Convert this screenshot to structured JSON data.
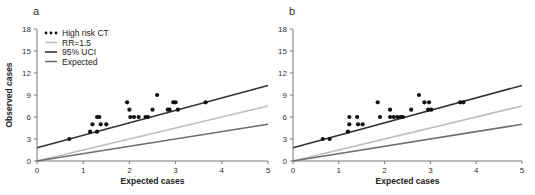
{
  "chart_data": [
    {
      "type": "scatter",
      "panel": "a",
      "title": "",
      "xlabel": "Expected cases",
      "ylabel": "Observed cases",
      "xlim": [
        0,
        5
      ],
      "ylim": [
        0,
        18
      ],
      "xticks": [
        0,
        1,
        2,
        3,
        4,
        5
      ],
      "yticks": [
        0,
        3,
        6,
        9,
        12,
        15,
        18
      ],
      "grid": false,
      "legend_position": "upper left",
      "legend": [
        "High risk CT",
        "RR=1.5",
        "95% UCI",
        "Expected"
      ],
      "series": [
        {
          "name": "High risk CT",
          "kind": "points",
          "color": "#111111",
          "points": [
            [
              0.7,
              3
            ],
            [
              1.15,
              4
            ],
            [
              1.2,
              5
            ],
            [
              1.3,
              4
            ],
            [
              1.3,
              6
            ],
            [
              1.35,
              6
            ],
            [
              1.38,
              5
            ],
            [
              1.5,
              5
            ],
            [
              1.95,
              8
            ],
            [
              2.0,
              7
            ],
            [
              2.02,
              6
            ],
            [
              2.1,
              6
            ],
            [
              2.2,
              6
            ],
            [
              2.35,
              6
            ],
            [
              2.4,
              6
            ],
            [
              2.5,
              7
            ],
            [
              2.6,
              9
            ],
            [
              2.83,
              7
            ],
            [
              2.87,
              7
            ],
            [
              2.95,
              8
            ],
            [
              3.0,
              8
            ],
            [
              3.05,
              7
            ],
            [
              3.65,
              8
            ]
          ]
        },
        {
          "name": "RR=1.5",
          "kind": "line",
          "color": "#bdbdbd",
          "x": [
            0,
            5
          ],
          "y": [
            0,
            7.5
          ]
        },
        {
          "name": "95% UCI",
          "kind": "line",
          "color": "#333333",
          "x": [
            0,
            5
          ],
          "y": [
            1.8,
            10.3
          ]
        },
        {
          "name": "Expected",
          "kind": "line",
          "color": "#6e6e6e",
          "x": [
            0,
            5
          ],
          "y": [
            0,
            5
          ]
        }
      ]
    },
    {
      "type": "scatter",
      "panel": "b",
      "title": "",
      "xlabel": "Expected cases",
      "ylabel": "",
      "xlim": [
        0,
        5
      ],
      "ylim": [
        0,
        18
      ],
      "xticks": [
        0,
        1,
        2,
        3,
        4,
        5
      ],
      "yticks": [
        0,
        3,
        6,
        9,
        12,
        15,
        18
      ],
      "grid": false,
      "series": [
        {
          "name": "High risk CT",
          "kind": "points",
          "color": "#111111",
          "points": [
            [
              0.65,
              3
            ],
            [
              0.8,
              3
            ],
            [
              1.2,
              4
            ],
            [
              1.23,
              6
            ],
            [
              1.23,
              5
            ],
            [
              1.4,
              6
            ],
            [
              1.42,
              5
            ],
            [
              1.52,
              5
            ],
            [
              1.85,
              8
            ],
            [
              1.9,
              6
            ],
            [
              2.12,
              7
            ],
            [
              2.12,
              6
            ],
            [
              2.2,
              6
            ],
            [
              2.28,
              6
            ],
            [
              2.35,
              6
            ],
            [
              2.4,
              6
            ],
            [
              2.58,
              7
            ],
            [
              2.75,
              9
            ],
            [
              2.87,
              8
            ],
            [
              2.97,
              8
            ],
            [
              2.95,
              7
            ],
            [
              3.02,
              7
            ],
            [
              3.65,
              8
            ],
            [
              3.72,
              8
            ]
          ]
        },
        {
          "name": "RR=1.5",
          "kind": "line",
          "color": "#bdbdbd",
          "x": [
            0,
            5
          ],
          "y": [
            0,
            7.5
          ]
        },
        {
          "name": "95% UCI",
          "kind": "line",
          "color": "#333333",
          "x": [
            0,
            5
          ],
          "y": [
            1.8,
            10.3
          ]
        },
        {
          "name": "Expected",
          "kind": "line",
          "color": "#6e6e6e",
          "x": [
            0,
            5
          ],
          "y": [
            0,
            5
          ]
        }
      ]
    }
  ],
  "panels": [
    {
      "label": "a",
      "left": 37,
      "right": 268,
      "top": 29,
      "bottom": 161,
      "show_ylabel": true,
      "show_legend": true
    },
    {
      "label": "b",
      "left": 293,
      "right": 522,
      "top": 29,
      "bottom": 161,
      "show_ylabel": false,
      "show_legend": false
    }
  ],
  "labels": {
    "xlabel": "Expected cases",
    "ylabel": "Observed cases",
    "legend": [
      "High risk CT",
      "RR=1.5",
      "95% UCI",
      "Expected"
    ]
  }
}
